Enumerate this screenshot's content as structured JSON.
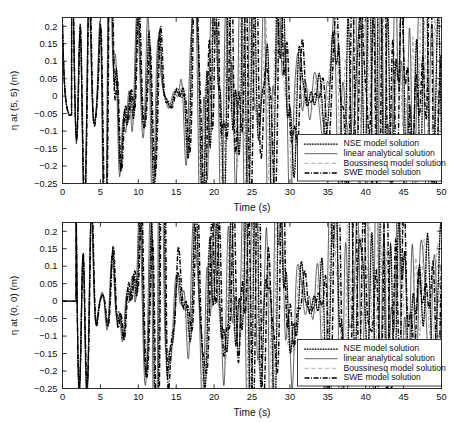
{
  "figure": {
    "panels": [
      {
        "id": "top",
        "ylabel": "η at (5, 5) (m)",
        "xlabel": "Time (s)"
      },
      {
        "id": "bottom",
        "ylabel": "η at (0, 0) (m)",
        "xlabel": "Time (s)"
      }
    ],
    "legend": {
      "entries": [
        {
          "label": "NSE model solution",
          "style": "dotted",
          "color": "#000000"
        },
        {
          "label": "linear analytical solution",
          "style": "solid",
          "color": "#000000"
        },
        {
          "label": "Boussinesq model solution",
          "style": "dashed",
          "color": "#8c8c8c"
        },
        {
          "label": "SWE model solution",
          "style": "dash-dot",
          "color": "#000000"
        }
      ]
    }
  },
  "chart_data": [
    {
      "type": "line",
      "id": "eta-at-5-5",
      "title": "",
      "xlabel": "Time (s)",
      "ylabel": "η at (5, 5) (m)",
      "xlim": [
        0,
        50
      ],
      "ylim": [
        -0.25,
        0.225
      ],
      "xticks": [
        0,
        5,
        10,
        15,
        20,
        25,
        30,
        35,
        40,
        45,
        50
      ],
      "yticks": [
        -0.25,
        -0.2,
        -0.15,
        -0.1,
        -0.05,
        0,
        0.05,
        0.1,
        0.15,
        0.2
      ],
      "ytick_labels": [
        "-0.25",
        "-0.2",
        "-0.15",
        "-0.1",
        "-0.05",
        "0",
        "0.05",
        "0.1",
        "0.15",
        "0.2"
      ],
      "grid": false,
      "legend_position": "lower right",
      "series": [
        {
          "name": "NSE model solution",
          "style": "dotted"
        },
        {
          "name": "linear analytical solution",
          "style": "solid"
        },
        {
          "name": "Boussinesq model solution",
          "style": "dashed"
        },
        {
          "name": "SWE model solution",
          "style": "dash-dot"
        }
      ],
      "notes": {
        "initial_transient": "all series begin near 0.20 at t=0 and drop sharply to about -0.07 by t=1.5",
        "typical_range": [
          -0.12,
          0.22
        ],
        "max_peak": {
          "t": 21.6,
          "value": 0.22,
          "series": "SWE model solution"
        },
        "min_trough": {
          "t": 25.1,
          "value": -0.115,
          "series": "linear analytical solution"
        },
        "phase_behaviour": "series agree closely for t < 18 s then diverge progressively in phase and amplitude"
      }
    },
    {
      "type": "line",
      "id": "eta-at-0-0",
      "title": "",
      "xlabel": "Time (s)",
      "ylabel": "η at (0, 0) (m)",
      "xlim": [
        0,
        50
      ],
      "ylim": [
        -0.25,
        0.225
      ],
      "xticks": [
        0,
        5,
        10,
        15,
        20,
        25,
        30,
        35,
        40,
        45,
        50
      ],
      "yticks": [
        -0.25,
        -0.2,
        -0.15,
        -0.1,
        -0.05,
        0,
        0.05,
        0.1,
        0.15,
        0.2
      ],
      "ytick_labels": [
        "-0.25",
        "-0.2",
        "-0.15",
        "-0.1",
        "-0.05",
        "0",
        "0.05",
        "0.1",
        "0.15",
        "0.2"
      ],
      "grid": false,
      "legend_position": "lower right",
      "series": [
        {
          "name": "NSE model solution",
          "style": "dotted"
        },
        {
          "name": "linear analytical solution",
          "style": "solid"
        },
        {
          "name": "Boussinesq model solution",
          "style": "dashed"
        },
        {
          "name": "SWE model solution",
          "style": "dash-dot"
        }
      ],
      "notes": {
        "initial_transient": "all series start at 0 and stay flat until about t=1.8 s",
        "typical_range": [
          -0.11,
          0.2
        ],
        "max_peak": {
          "t": 15.2,
          "value": 0.2,
          "series": "SWE model solution"
        },
        "min_trough": {
          "t": 8.6,
          "value": -0.11,
          "series": "linear analytical solution"
        },
        "phase_behaviour": "close agreement for t < 14 s, growing phase lag afterwards"
      }
    }
  ]
}
